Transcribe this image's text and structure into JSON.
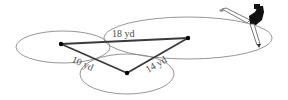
{
  "diagram": {
    "type": "triangle-construction-with-compass",
    "labels": {
      "side_top": "18 yd",
      "side_left": "10 yd",
      "side_right": "14 yd"
    },
    "vertices": {
      "A": {
        "x": 61,
        "y": 44
      },
      "B": {
        "x": 127,
        "y": 73
      },
      "C": {
        "x": 188,
        "y": 38
      }
    },
    "arcs": [
      {
        "name": "left-circle",
        "cx": 63,
        "cy": 47,
        "rx": 47,
        "ry": 16
      },
      {
        "name": "bottom-circle",
        "cx": 127,
        "cy": 74,
        "rx": 47,
        "ry": 20
      },
      {
        "name": "large-circle",
        "cx": 188,
        "cy": 38,
        "rx": 84,
        "ry": 21
      }
    ],
    "colors": {
      "arc": "#8a8a8a",
      "side": "#3a3a3a",
      "vertex": "#000000",
      "label": "#4a4a4a"
    }
  }
}
